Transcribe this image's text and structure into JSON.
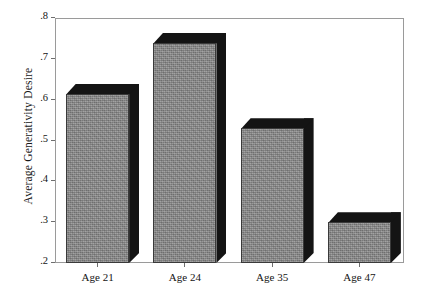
{
  "chart_data": {
    "type": "bar",
    "title": "",
    "xlabel": "",
    "ylabel": "Average Generativity Desire",
    "categories": [
      "Age 21",
      "Age 24",
      "Age 35",
      "Age 47"
    ],
    "values": [
      0.615,
      0.74,
      0.53,
      0.3
    ],
    "ylim": [
      0.2,
      0.8
    ],
    "ytick_labels": [
      ".8",
      ".7",
      ".6",
      ".5",
      ".4",
      ".3",
      ".2"
    ],
    "ytick_values": [
      0.8,
      0.7,
      0.6,
      0.5,
      0.4,
      0.3,
      0.2
    ],
    "grid": false,
    "legend": null,
    "style": "3d-bar",
    "bar_face_color": "#8b8b8b",
    "bar_shadow_color": "#141414",
    "frame_color": "#9a9a9a",
    "background_color": "#ffffff"
  }
}
